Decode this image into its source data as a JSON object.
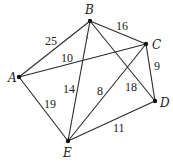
{
  "diagram": {
    "type": "weighted-undirected-graph",
    "nodes": [
      {
        "id": "A",
        "label": "A",
        "x": 19,
        "y": 77,
        "lx": 8,
        "ly": 82
      },
      {
        "id": "B",
        "label": "B",
        "x": 90,
        "y": 21,
        "lx": 85,
        "ly": 14
      },
      {
        "id": "C",
        "label": "C",
        "x": 146,
        "y": 44,
        "lx": 152,
        "ly": 49
      },
      {
        "id": "D",
        "label": "D",
        "x": 155,
        "y": 101,
        "lx": 160,
        "ly": 107
      },
      {
        "id": "E",
        "label": "E",
        "x": 68,
        "y": 141,
        "lx": 63,
        "ly": 157
      }
    ],
    "edges": [
      {
        "from": "A",
        "to": "B",
        "weight": "25",
        "lx": 45,
        "ly": 45
      },
      {
        "from": "A",
        "to": "C",
        "weight": "10",
        "lx": 61,
        "ly": 62
      },
      {
        "from": "A",
        "to": "E",
        "weight": "19",
        "lx": 44,
        "ly": 108
      },
      {
        "from": "B",
        "to": "C",
        "weight": "16",
        "lx": 116,
        "ly": 30
      },
      {
        "from": "B",
        "to": "E",
        "weight": "14",
        "lx": 63,
        "ly": 93
      },
      {
        "from": "B",
        "to": "D",
        "weight": "18",
        "lx": 125,
        "ly": 91
      },
      {
        "from": "C",
        "to": "E",
        "weight": "8",
        "lx": 97,
        "ly": 95
      },
      {
        "from": "C",
        "to": "D",
        "weight": "9",
        "lx": 154,
        "ly": 70
      },
      {
        "from": "D",
        "to": "E",
        "weight": "11",
        "lx": 113,
        "ly": 132
      }
    ]
  }
}
